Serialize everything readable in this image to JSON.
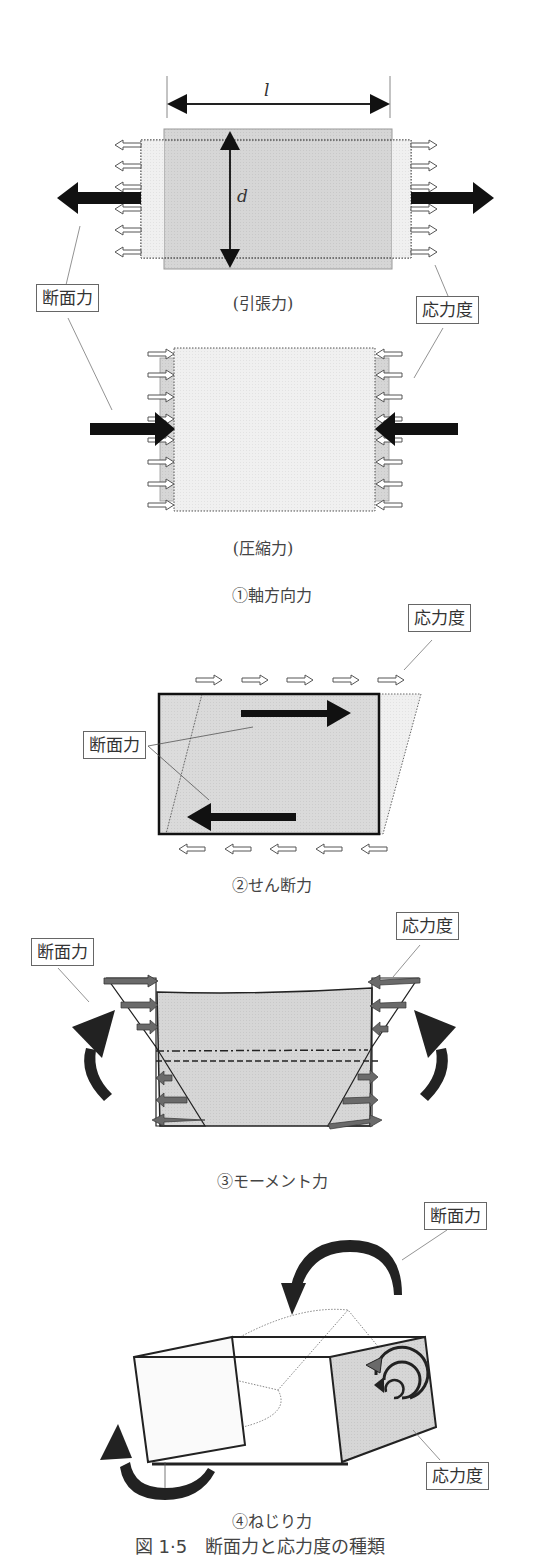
{
  "figure": {
    "title": "図 1·5　断面力と応力度の種類"
  },
  "panels": [
    {
      "id": "axial",
      "caption": "①軸方向力",
      "subpanels": [
        {
          "caption": "(引張力)",
          "dimension_length": "l",
          "dimension_depth": "d"
        },
        {
          "caption": "(圧縮力)"
        }
      ],
      "labels": {
        "section_force": "断面力",
        "stress": "応力度"
      }
    },
    {
      "id": "shear",
      "caption": "②せん断力",
      "labels": {
        "section_force": "断面力",
        "stress": "応力度"
      }
    },
    {
      "id": "moment",
      "caption": "③モーメント力",
      "labels": {
        "section_force": "断面力",
        "stress": "応力度"
      }
    },
    {
      "id": "torsion",
      "caption": "④ねじり力",
      "labels": {
        "section_force": "断面力",
        "stress": "応力度"
      }
    }
  ],
  "colors": {
    "body_fill": "#d8d8d8",
    "light_fill": "#eeeeee",
    "arrow_dark": "#111111",
    "arrow_gray": "#6a6a6a",
    "line": "#444444"
  }
}
